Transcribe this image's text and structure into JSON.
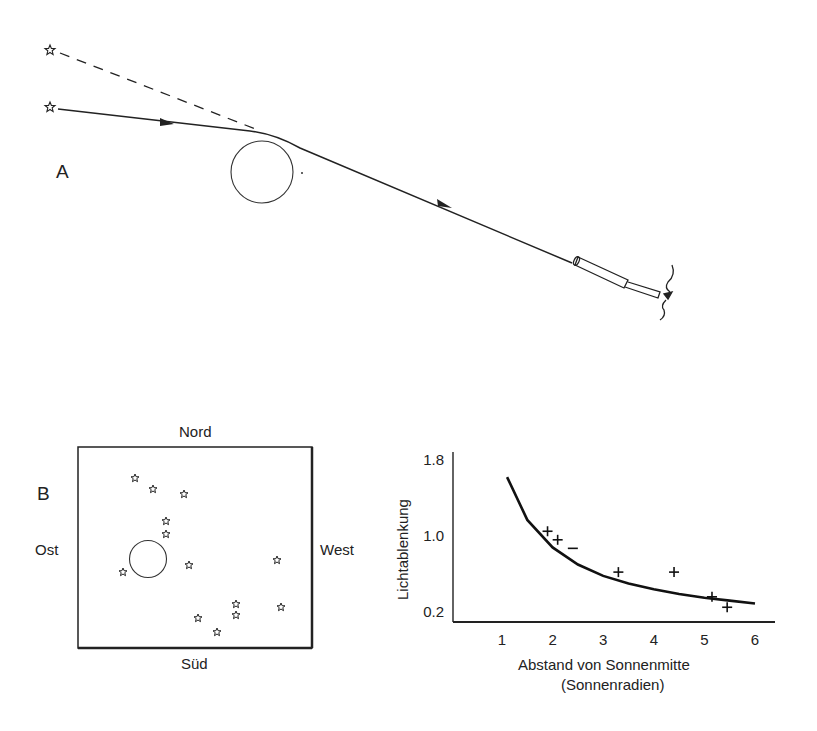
{
  "panel_a": {
    "label": "A",
    "apparent_star": "star-icon",
    "real_star": "star-icon"
  },
  "panel_b": {
    "label": "B",
    "north": "Nord",
    "south": "Süd",
    "east": "Ost",
    "west": "West",
    "stars": [
      [
        135,
        478
      ],
      [
        153,
        489
      ],
      [
        184,
        494
      ],
      [
        166,
        521
      ],
      [
        166,
        534
      ],
      [
        123,
        572
      ],
      [
        189,
        565
      ],
      [
        277,
        560
      ],
      [
        281,
        607
      ],
      [
        198,
        618
      ],
      [
        217,
        632
      ],
      [
        236,
        604
      ],
      [
        236,
        615
      ]
    ]
  },
  "chart_data": {
    "type": "scatter",
    "title": "",
    "xlabel": "Abstand von Sonnenmitte",
    "xlabel_line2": "(Sonnenradien)",
    "ylabel": "Lichtablenkung",
    "x_ticks": [
      "1",
      "2",
      "3",
      "4",
      "5",
      "6"
    ],
    "y_ticks": [
      "1.8",
      "1.0",
      "0.2"
    ],
    "xlim": [
      0,
      6.3
    ],
    "ylim": [
      0.1,
      1.9
    ],
    "curve": {
      "name": "theoretical deflection",
      "x": [
        1.1,
        1.5,
        2.0,
        2.5,
        3.0,
        3.5,
        4.0,
        4.5,
        5.0,
        5.5,
        6.0
      ],
      "y": [
        1.62,
        1.17,
        0.88,
        0.7,
        0.58,
        0.5,
        0.44,
        0.39,
        0.35,
        0.32,
        0.29
      ]
    },
    "measurements": {
      "name": "observed",
      "x": [
        1.9,
        2.1,
        2.4,
        3.3,
        4.4,
        5.15,
        5.45
      ],
      "y": [
        1.05,
        0.96,
        0.87,
        0.62,
        0.62,
        0.36,
        0.25
      ],
      "markers": [
        "+",
        "+",
        "-",
        "+",
        "+",
        "+",
        "+"
      ]
    },
    "grid": false,
    "legend": null
  }
}
